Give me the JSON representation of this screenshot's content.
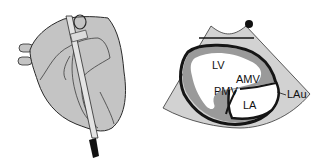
{
  "figure": {
    "left_panel": {
      "description": "Heart with transducer probe positioned along the surface",
      "colors": {
        "heart_fill": "#c4c4c4",
        "outline": "#2a2a2a",
        "probe_tip": "#111111"
      }
    },
    "right_panel": {
      "description": "Echocardiographic sector view",
      "labels": {
        "lv": "LV",
        "amv": "AMV",
        "pmv": "PMV",
        "la": "LA",
        "lau": "LAu"
      },
      "colors": {
        "sector_fill": "#d2d2d2",
        "myocardium": "#9a9a9a",
        "chamber": "#ffffff",
        "wall": "#151515"
      }
    }
  }
}
